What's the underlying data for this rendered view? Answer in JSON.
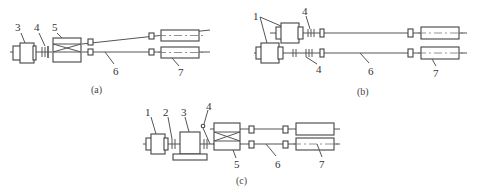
{
  "figure": {
    "panels": [
      {
        "id": "a",
        "caption": "(a)",
        "labels": [
          "3",
          "4",
          "5",
          "6",
          "7"
        ]
      },
      {
        "id": "b",
        "caption": "(b)",
        "labels": [
          "1",
          "4",
          "4",
          "6",
          "7"
        ]
      },
      {
        "id": "c",
        "caption": "(c)",
        "labels": [
          "1",
          "2",
          "3",
          "4",
          "5",
          "6",
          "7"
        ]
      }
    ]
  },
  "labels": {
    "a": {
      "l3": "3",
      "l4": "4",
      "l5": "5",
      "l6": "6",
      "l7": "7",
      "caption": "(a)"
    },
    "b": {
      "l1": "1",
      "l4a": "4",
      "l4b": "4",
      "l6": "6",
      "l7": "7",
      "caption": "(b)"
    },
    "c": {
      "l1": "1",
      "l2": "2",
      "l3": "3",
      "l4": "4",
      "l5": "5",
      "l6": "6",
      "l7": "7",
      "caption": "(c)"
    }
  }
}
